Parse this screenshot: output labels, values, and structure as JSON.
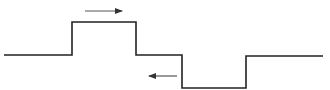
{
  "diagram": {
    "type": "square-pulse-waveform",
    "baseline_y": 55,
    "waveform_points": [
      [
        4,
        55
      ],
      [
        72,
        55
      ],
      [
        72,
        22
      ],
      [
        136,
        22
      ],
      [
        136,
        55
      ],
      [
        182,
        55
      ],
      [
        182,
        88
      ],
      [
        246,
        88
      ],
      [
        246,
        56
      ],
      [
        323,
        56
      ]
    ],
    "line_color": "#222222",
    "arrow_color": "#333333",
    "arrows": [
      {
        "direction": "right",
        "x1": 85,
        "x2": 122,
        "y": 11
      },
      {
        "direction": "left",
        "x1": 177,
        "x2": 149,
        "y": 76
      }
    ]
  }
}
